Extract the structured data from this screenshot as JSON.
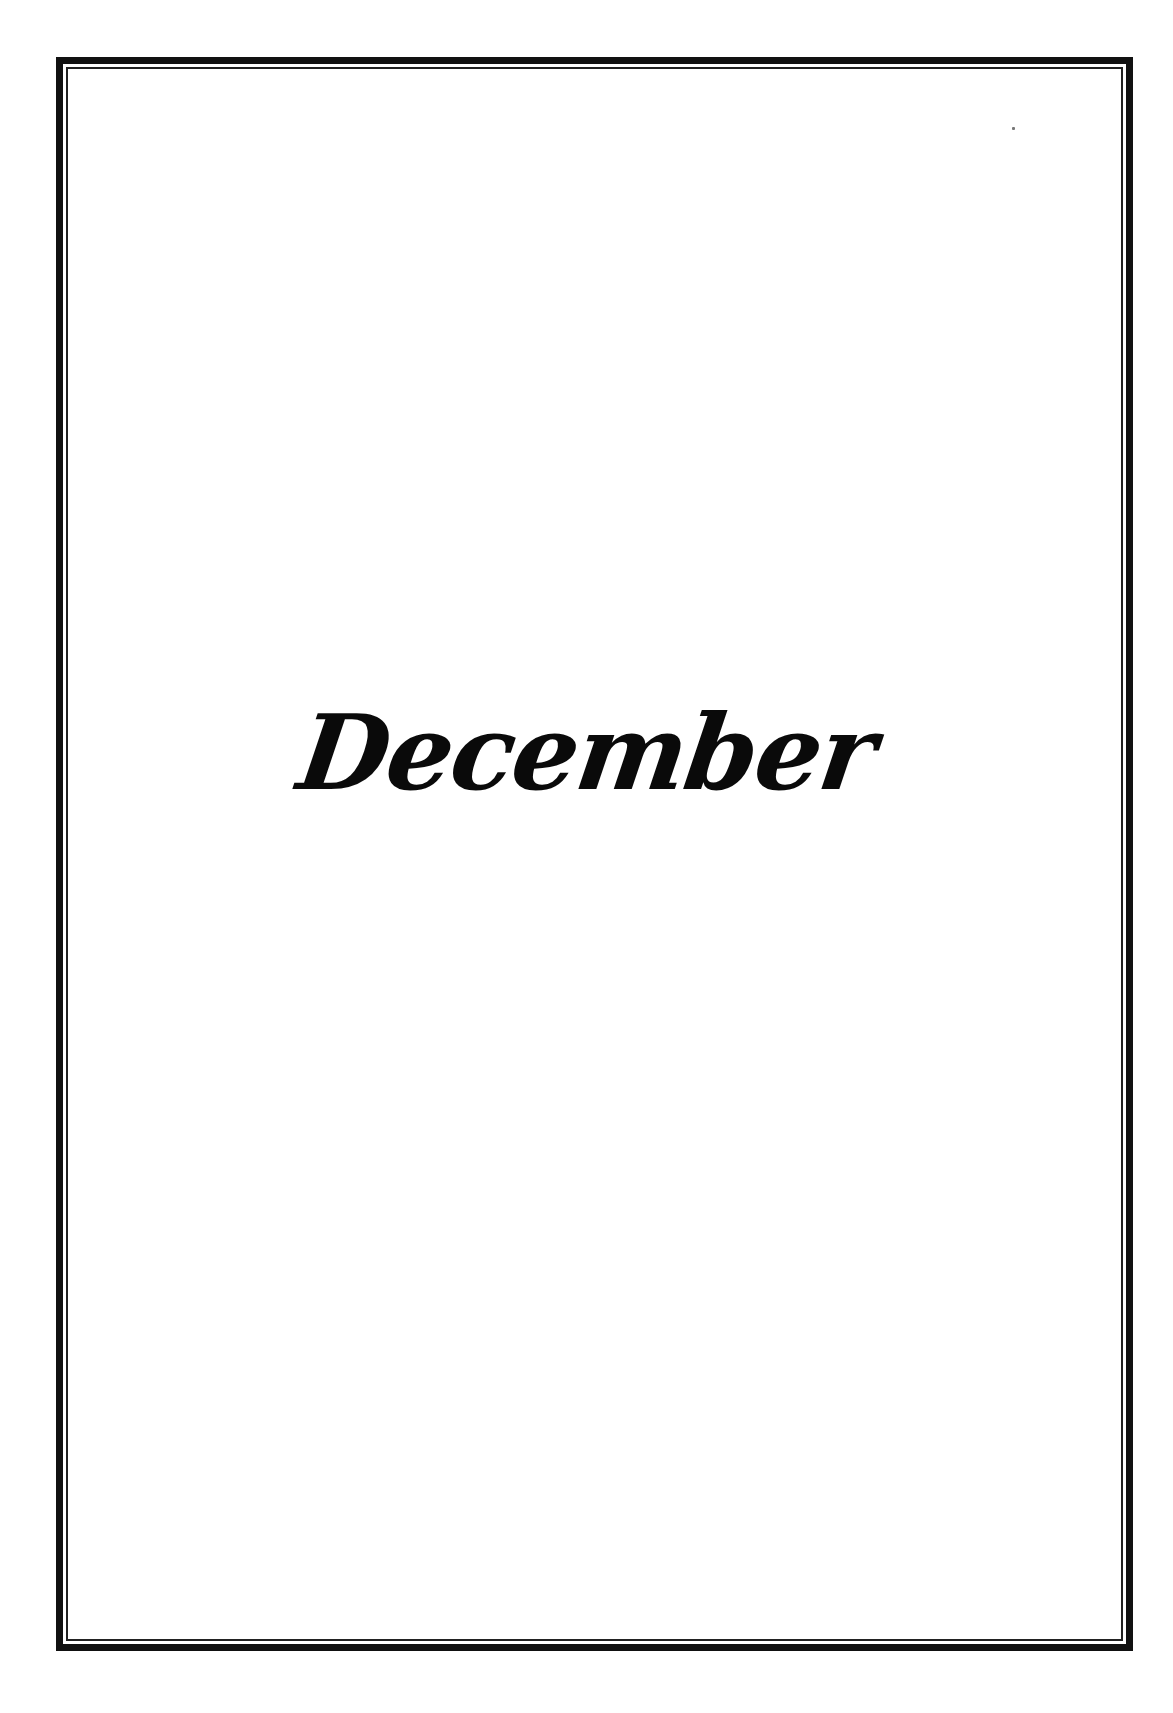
{
  "page": {
    "title": "December",
    "colors": {
      "background": "#ffffff",
      "frame": "#111111",
      "text": "#0a0a0a"
    }
  }
}
